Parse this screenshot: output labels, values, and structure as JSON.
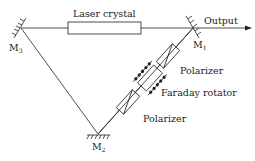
{
  "diagram": {
    "labels": {
      "laser_crystal": "Laser crystal",
      "output": "Output",
      "m1": "M",
      "m1_sub": "1",
      "m2": "M",
      "m2_sub": "2",
      "m3": "M",
      "m3_sub": "3",
      "polarizer_top": "Polarizer",
      "faraday_rotator": "Faraday rotator",
      "polarizer_bottom": "Polarizer"
    },
    "colors": {
      "line": "#222222",
      "background": "#ffffff"
    }
  }
}
